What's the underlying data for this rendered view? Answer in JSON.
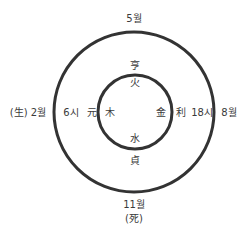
{
  "diagram": {
    "outer_circle": {
      "cx": 134,
      "cy": 112,
      "r": 80,
      "stroke": "#333333",
      "stroke_width": 3
    },
    "inner_circle": {
      "cx": 135,
      "cy": 112,
      "r": 37,
      "stroke": "#333333",
      "stroke_width": 3
    },
    "outer_labels": {
      "top": "5월",
      "right": "8월",
      "bottom_month": "11월",
      "bottom_note": "(死)",
      "left": "(生) 2월"
    },
    "time_labels": {
      "left": "6시",
      "right": "18시"
    },
    "virtue_labels": {
      "top": "亨",
      "left": "元",
      "right": "利",
      "bottom": "貞"
    },
    "element_labels": {
      "top": "火",
      "left": "木",
      "right": "金",
      "bottom": "水"
    }
  }
}
